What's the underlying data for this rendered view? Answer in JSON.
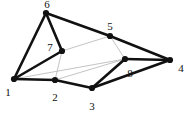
{
  "figure": {
    "name": "polyhedron-vertex-graph",
    "background_color": "#ffffff",
    "width": 190,
    "height": 116
  },
  "style": {
    "edge_thick_color": "#111111",
    "edge_thick_width": 2.6,
    "edge_thin_color": "#b4b4b4",
    "edge_thin_width": 0.8,
    "node_color": "#111111",
    "node_radius": 3.1,
    "label_color": "#111111",
    "label_font_size": 11
  },
  "chart_data": {
    "type": "diagram",
    "title": "",
    "nodes": [
      {
        "id": "1",
        "label": "1",
        "x": 14,
        "y": 79,
        "label_x": 8,
        "label_y": 92
      },
      {
        "id": "2",
        "label": "2",
        "x": 55,
        "y": 80,
        "label_x": 55,
        "label_y": 97
      },
      {
        "id": "3",
        "label": "3",
        "x": 92,
        "y": 88,
        "label_x": 92,
        "label_y": 106
      },
      {
        "id": "4",
        "label": "4",
        "x": 170,
        "y": 60,
        "label_x": 181,
        "label_y": 68
      },
      {
        "id": "5",
        "label": "5",
        "x": 110,
        "y": 36,
        "label_x": 110,
        "label_y": 26
      },
      {
        "id": "6",
        "label": "6",
        "x": 46,
        "y": 13,
        "label_x": 47,
        "label_y": 4
      },
      {
        "id": "7",
        "label": "7",
        "x": 62,
        "y": 51,
        "label_x": 50,
        "label_y": 47
      },
      {
        "id": "8",
        "label": "8",
        "x": 125,
        "y": 59,
        "label_x": 130,
        "label_y": 73
      }
    ],
    "edges": [
      {
        "from": "1",
        "to": "6",
        "weight": "thick"
      },
      {
        "from": "6",
        "to": "7",
        "weight": "thick"
      },
      {
        "from": "7",
        "to": "1",
        "weight": "thick"
      },
      {
        "from": "6",
        "to": "5",
        "weight": "thick"
      },
      {
        "from": "5",
        "to": "4",
        "weight": "thick"
      },
      {
        "from": "1",
        "to": "2",
        "weight": "thick"
      },
      {
        "from": "2",
        "to": "3",
        "weight": "thick"
      },
      {
        "from": "3",
        "to": "8",
        "weight": "thick"
      },
      {
        "from": "8",
        "to": "4",
        "weight": "thick"
      },
      {
        "from": "3",
        "to": "4",
        "weight": "thick"
      },
      {
        "from": "7",
        "to": "5",
        "weight": "thin"
      },
      {
        "from": "5",
        "to": "8",
        "weight": "thin"
      },
      {
        "from": "8",
        "to": "2",
        "weight": "thin"
      },
      {
        "from": "2",
        "to": "7",
        "weight": "thin"
      },
      {
        "from": "1",
        "to": "8",
        "weight": "thin"
      }
    ]
  }
}
